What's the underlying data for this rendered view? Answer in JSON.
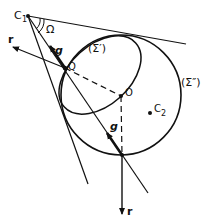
{
  "diagram": {
    "labels": {
      "c1": "C",
      "c1_sub": "1",
      "omega": "Ω",
      "g_top": "g",
      "g_bottom": "g",
      "q": "Q",
      "o": "O",
      "c2": "C",
      "c2_sub": "2",
      "sigma_prime": "(Σ′)",
      "sigma_double_prime": "(Σ″)",
      "r_left": "r",
      "r_bottom": "r"
    },
    "colors": {
      "stroke": "#111111",
      "background": "#ffffff"
    }
  }
}
